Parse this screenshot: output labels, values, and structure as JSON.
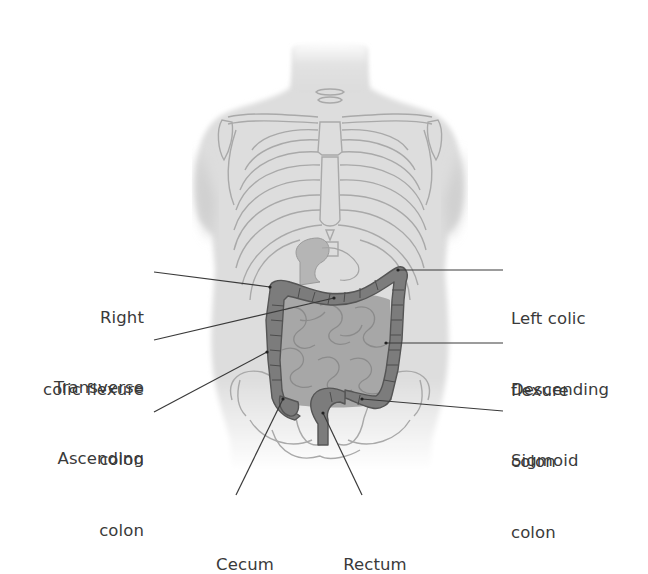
{
  "figure": {
    "colors": {
      "background": "#ffffff",
      "skin": "#dcdcdc",
      "skin_shadow": "#c9c9c9",
      "skeleton_line": "#a8a8a8",
      "small_intestine": "#a2a2a2",
      "colon_fill": "#7a7a7a",
      "colon_edge": "#555555",
      "leader_line": "#3a3a3a",
      "label_text": "#3a3a3a"
    }
  },
  "labels": {
    "right_colic_flexure": {
      "line1": "Right",
      "line2": "colic flexure"
    },
    "transverse_colon": {
      "line1": "Transverse",
      "line2": "colon"
    },
    "ascending_colon": {
      "line1": "Ascending",
      "line2": "colon"
    },
    "left_colic_flexure": {
      "line1": "Left colic",
      "line2": "flexure"
    },
    "descending_colon": {
      "line1": "Descending",
      "line2": "colon"
    },
    "sigmoid_colon": {
      "line1": "Sigmoid",
      "line2": "colon"
    },
    "cecum": {
      "line1": "Cecum"
    },
    "rectum": {
      "line1": "Rectum"
    }
  }
}
